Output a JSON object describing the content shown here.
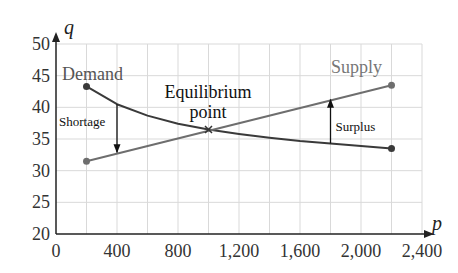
{
  "chart_data": {
    "type": "line",
    "title": "",
    "xlabel": "p",
    "ylabel": "q",
    "xlim": [
      0,
      2400
    ],
    "ylim": [
      20,
      50
    ],
    "x_ticks": [
      0,
      400,
      800,
      1200,
      1600,
      2000,
      2400
    ],
    "x_tick_labels": [
      "0",
      "400",
      "800",
      "1,200",
      "1,600",
      "2,000",
      "2,400"
    ],
    "y_ticks": [
      20,
      25,
      30,
      35,
      40,
      45,
      50
    ],
    "y_tick_labels": [
      "20",
      "25",
      "30",
      "35",
      "40",
      "45",
      "50"
    ],
    "grid": true,
    "grid_x_step": 200,
    "grid_y_step": 5,
    "series": [
      {
        "name": "Demand",
        "color": "#3a3a3a",
        "x": [
          200,
          400,
          600,
          800,
          1000,
          1200,
          1400,
          1600,
          1800,
          2000,
          2200
        ],
        "values": [
          43.3,
          40.5,
          38.7,
          37.4,
          36.5,
          35.8,
          35.2,
          34.7,
          34.3,
          33.9,
          33.5
        ]
      },
      {
        "name": "Supply",
        "color": "#6e6e6e",
        "x": [
          200,
          2200
        ],
        "values": [
          31.5,
          43.5
        ]
      }
    ],
    "annotations": [
      {
        "text": "Equilibrium",
        "x": 1000,
        "y": 40.5
      },
      {
        "text": "point",
        "x": 1000,
        "y": 38.5
      },
      {
        "text": "Shortage",
        "arrow_from": [
          400,
          40.5
        ],
        "arrow_to": [
          400,
          32.7
        ],
        "direction": "down"
      },
      {
        "text": "Surplus",
        "arrow_from": [
          1800,
          34.3
        ],
        "arrow_to": [
          1800,
          41.3
        ],
        "direction": "up"
      },
      {
        "text": "Demand",
        "x": 290,
        "y": 45.5
      },
      {
        "text": "Supply",
        "x": 2000,
        "y": 46
      }
    ],
    "equilibrium_point": {
      "x": 1000,
      "y": 36.5,
      "marker": "x"
    }
  },
  "labels": {
    "y_axis": "q",
    "x_axis": "p",
    "demand": "Demand",
    "supply": "Supply",
    "equilibrium_line1": "Equilibrium",
    "equilibrium_line2": "point",
    "shortage": "Shortage",
    "surplus": "Surplus"
  }
}
